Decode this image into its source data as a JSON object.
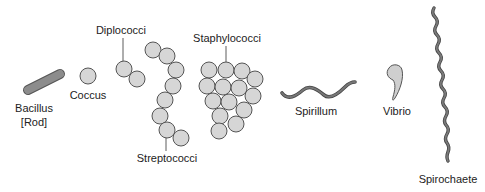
{
  "colors": {
    "cell_fill": "#d6d6d6",
    "cell_stroke": "#555555",
    "rod_fill": "#8c8c8c",
    "spiral_stroke": "#666666",
    "text": "#222222"
  },
  "labels": {
    "bacillus_line1": "Bacillus",
    "bacillus_line2": "[Rod]",
    "coccus": "Coccus",
    "diplococci": "Diplococci",
    "streptococci": "Streptococci",
    "staphylococci": "Staphylococci",
    "spirillum": "Spirillum",
    "vibrio": "Vibrio",
    "spirochaete": "Spirochaete"
  }
}
